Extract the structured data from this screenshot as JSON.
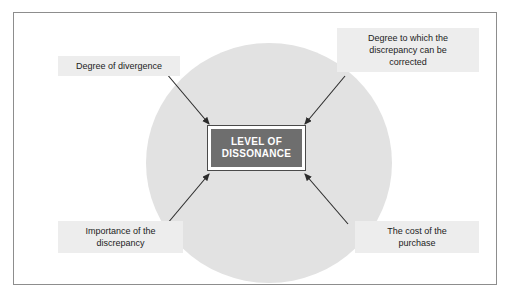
{
  "diagram": {
    "center": {
      "line1": "LEVEL OF",
      "line2": "DISSONANCE"
    },
    "factors": [
      {
        "id": "degree-of-divergence",
        "position": "top-left",
        "lines": [
          "Degree of divergence"
        ]
      },
      {
        "id": "degree-to-which-discrepancy-corrected",
        "position": "top-right",
        "lines": [
          "Degree to which the",
          "discrepancy can be",
          "corrected"
        ]
      },
      {
        "id": "importance-of-the-discrepancy",
        "position": "bottom-left",
        "lines": [
          "Importance of the",
          "discrepancy"
        ]
      },
      {
        "id": "cost-of-the-purchase",
        "position": "bottom-right",
        "lines": [
          "The cost of the",
          "purchase"
        ]
      }
    ],
    "colors": {
      "frame_border": "#8d8d8d",
      "circle_fill": "#e2e2e2",
      "center_box_fill": "#6e6e6e",
      "center_box_text": "#ffffff",
      "center_box_halo": "#ffffff",
      "factor_fill": "#ededed",
      "factor_text": "#1c1c1c",
      "arrow_stroke": "#2b2b2b",
      "page_background": "#ffffff"
    },
    "arrows": [
      {
        "id": "arrow-from-degree-of-divergence",
        "from": "top-left",
        "to": "center"
      },
      {
        "id": "arrow-from-discrepancy-corrected",
        "from": "top-right",
        "to": "center"
      },
      {
        "id": "arrow-from-importance-of-discrepancy",
        "from": "bottom-left",
        "to": "center"
      },
      {
        "id": "arrow-from-cost-of-purchase",
        "from": "bottom-right",
        "to": "center"
      }
    ]
  }
}
